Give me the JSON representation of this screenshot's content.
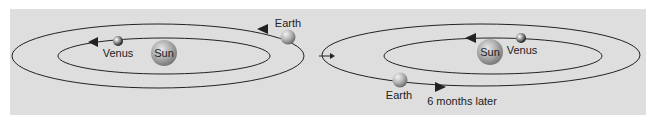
{
  "diagram": {
    "left": {
      "sun_label": "Sun",
      "venus_label": "Venus",
      "earth_label": "Earth"
    },
    "right": {
      "sun_label": "Sun",
      "venus_label": "Venus",
      "earth_label": "Earth",
      "caption": "6 months later"
    },
    "colors": {
      "background": "#dedede",
      "orbit": "#222222",
      "sun": "#a9a9a9"
    }
  }
}
